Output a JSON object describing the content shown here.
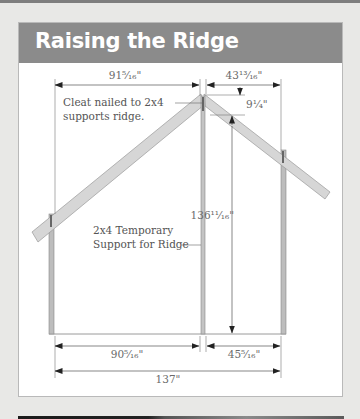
{
  "title": "Raising the Ridge",
  "colors": {
    "header_bg": "#8b8b8b",
    "title_text": "#ffffff",
    "lumber_fill": "#d4d4d4",
    "line": "#6a6a6a"
  },
  "labels": {
    "cleat_line1": "Cleat nailed to 2x4",
    "cleat_line2": "supports ridge.",
    "support_line1": "2x4 Temporary",
    "support_line2": "Support for Ridge"
  },
  "dimensions": {
    "top_left_run": "91⁵⁄₁₆\"",
    "top_right_run": "43¹³⁄₁₆\"",
    "ridge_drop": "9¹⁄₄\"",
    "ridge_height": "136¹¹⁄₁₆\"",
    "bottom_left": "90⁵⁄₁₆\"",
    "bottom_right": "45⁵⁄₁₆\"",
    "overall_width": "137\""
  }
}
